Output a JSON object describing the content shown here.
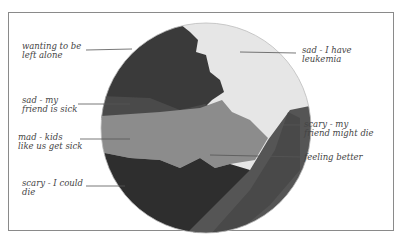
{
  "diagram": {
    "type": "feelings-pie-drawing",
    "colors": {
      "background": "#ffffff",
      "frame": "#8a8a8a",
      "black_segment": "#2e2e2e",
      "dark_gray_segment": "#4a4a4a",
      "medium_gray_segment": "#8c8c8c",
      "light_segment": "#e6e6e6",
      "leader_line": "#555555",
      "text": "#444444"
    },
    "labels": [
      {
        "id": "wanting-alone",
        "line1": "wanting to be",
        "line2": "left alone"
      },
      {
        "id": "sad-friend-sick",
        "line1": "sad - my",
        "line2": "friend is sick"
      },
      {
        "id": "mad-kids-sick",
        "line1": "mad - kids",
        "line2": "like us get sick"
      },
      {
        "id": "scary-could-die",
        "line1": "scary - I could",
        "line2": "die"
      },
      {
        "id": "sad-leukemia",
        "line1": "sad - I have",
        "line2": "leukemia"
      },
      {
        "id": "scary-friend-die",
        "line1": "scary - my",
        "line2": "friend might die"
      },
      {
        "id": "feeling-better",
        "line1": "feeling better",
        "line2": ""
      }
    ]
  }
}
